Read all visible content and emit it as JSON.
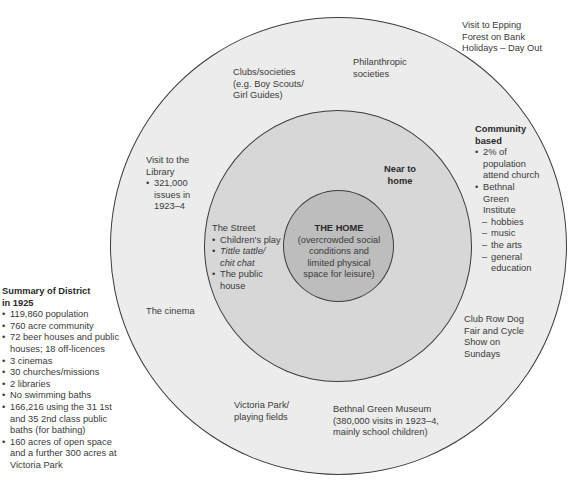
{
  "diagram": {
    "type": "concentric-circles",
    "colors": {
      "outer": "#ececec",
      "middle": "#d7d7d7",
      "inner": "#bdbdbd",
      "stroke": "#3c3c3c"
    },
    "home": {
      "title": "THE HOME",
      "desc": [
        "(overcrowded social",
        "conditions and",
        "limited physical",
        "space for leisure)"
      ]
    },
    "near_home": {
      "title": [
        "Near to",
        "home"
      ],
      "street": {
        "title": "The Street",
        "items": [
          "Children's play",
          "Tittle tattle/",
          "chit chat",
          "The public",
          "house"
        ]
      }
    },
    "outer_ring": {
      "clubs": [
        "Clubs/societies",
        "(e.g. Boy Scouts/",
        "Girl Guides)"
      ],
      "philanthropic": [
        "Philanthropic",
        "societies"
      ],
      "library": {
        "title": [
          "Visit to the",
          "Library"
        ],
        "items": [
          "321,000",
          "issues in",
          "1923–4"
        ]
      },
      "cinema": "The cinema",
      "community": {
        "title": [
          "Community",
          "based"
        ],
        "items": [
          "2% of",
          "population",
          "attend church",
          "Bethnal",
          "Green",
          "Institute"
        ],
        "subitems": [
          "hobbies",
          "music",
          "the arts",
          "general",
          "education"
        ]
      },
      "club_row": [
        "Club Row Dog",
        "Fair and Cycle",
        "Show on",
        "Sundays"
      ],
      "victoria_park": [
        "Victoria Park/",
        "playing fields"
      ],
      "museum": [
        "Bethnal Green Museum",
        "(380,000 visits in 1923–4,",
        "mainly school children)"
      ]
    },
    "epping": [
      "Visit to Epping",
      "Forest on Bank",
      "Holidays – Day Out"
    ],
    "summary": {
      "title": [
        "Summary of District",
        "in 1925"
      ],
      "items": [
        [
          "119,860 population"
        ],
        [
          "760 acre community"
        ],
        [
          "72 beer houses and public",
          "houses; 18 off-licences"
        ],
        [
          "3 cinemas"
        ],
        [
          "30 churches/missions"
        ],
        [
          "2 libraries"
        ],
        [
          "No swimming baths"
        ],
        [
          "166,216 using the 31 1st",
          "and 35 2nd class public",
          "baths (for bathing)"
        ],
        [
          "160 acres of open space",
          "and a further 300 acres at",
          "Victoria Park"
        ]
      ]
    }
  }
}
